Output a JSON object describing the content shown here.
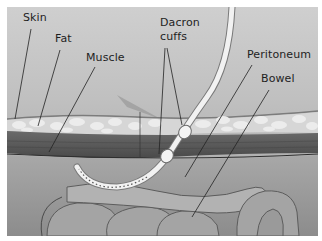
{
  "diagram": {
    "title": "",
    "labels": {
      "skin": "Skin",
      "fat": "Fat",
      "muscle": "Muscle",
      "dacron_line1": "Dacron",
      "dacron_line2": "cuffs",
      "peritoneum": "Peritoneum",
      "bowel": "Bowel"
    },
    "layers": [
      "Skin",
      "Fat",
      "Muscle",
      "Peritoneum",
      "Bowel"
    ],
    "components": [
      "Catheter",
      "Dacron cuffs (2)",
      "Perforated catheter tip"
    ],
    "colors": {
      "background": "#c4c4c4",
      "fat": "#e2e2e2",
      "muscle": "#5a5a5a",
      "catheter": "#f0f0f0",
      "label_text": "#1e1e1e"
    }
  }
}
